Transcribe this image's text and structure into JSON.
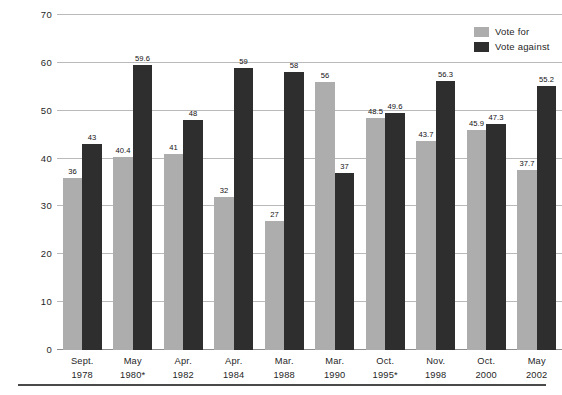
{
  "chart_data": {
    "type": "bar",
    "title": "",
    "subtitle": "",
    "xlabel": "",
    "ylabel": "Per cent",
    "ylim": [
      0,
      70
    ],
    "ytick_step": 10,
    "yticks": [
      0,
      10,
      20,
      30,
      40,
      50,
      60,
      70
    ],
    "ytick_labels": [
      "0",
      "10",
      "20",
      "30",
      "40",
      "50",
      "60",
      "70"
    ],
    "grid": true,
    "legend_position": "top-right",
    "categories": [
      "Sept. 1978",
      "May 1980*",
      "Apr. 1982",
      "Apr. 1984",
      "Mar. 1988",
      "Mar. 1990",
      "Oct. 1995*",
      "Nov. 1998",
      "Oct. 2000",
      "May 2002"
    ],
    "category_lines": [
      {
        "line1": "Sept.",
        "line2": "1978"
      },
      {
        "line1": "May",
        "line2": "1980*"
      },
      {
        "line1": "Apr.",
        "line2": "1982"
      },
      {
        "line1": "Apr.",
        "line2": "1984"
      },
      {
        "line1": "Mar.",
        "line2": "1988"
      },
      {
        "line1": "Mar.",
        "line2": "1990"
      },
      {
        "line1": "Oct.",
        "line2": "1995*"
      },
      {
        "line1": "Nov.",
        "line2": "1998"
      },
      {
        "line1": "Oct.",
        "line2": "2000"
      },
      {
        "line1": "May",
        "line2": "2002"
      }
    ],
    "series": [
      {
        "name": "Vote for",
        "color": "#adadad",
        "values": [
          36,
          40.4,
          41,
          32,
          27,
          56,
          48.5,
          43.7,
          45.9,
          37.7
        ],
        "labels": [
          "36",
          "40.4",
          "41",
          "32",
          "27",
          "56",
          "48.5",
          "43.7",
          "45.9",
          "37.7"
        ]
      },
      {
        "name": "Vote against",
        "color": "#2e2e2e",
        "values": [
          43,
          59.6,
          48,
          59,
          58,
          37,
          49.6,
          56.3,
          47.3,
          55.2
        ],
        "labels": [
          "43",
          "59.6",
          "48",
          "59",
          "58",
          "37",
          "49.6",
          "56.3",
          "47.3",
          "55.2"
        ]
      }
    ]
  },
  "legend": {
    "items": [
      {
        "label": "Vote for",
        "color": "#adadad"
      },
      {
        "label": "Vote against",
        "color": "#2e2e2e"
      }
    ]
  }
}
